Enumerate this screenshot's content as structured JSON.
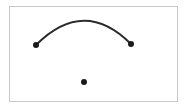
{
  "diagram": {
    "frame": {
      "x": 9.5,
      "y": 6.5,
      "width": 168,
      "height": 95,
      "stroke": "#c8c8c8"
    },
    "arc": {
      "start": {
        "x": 36,
        "y": 45
      },
      "control": {
        "x": 84,
        "y": -3
      },
      "end": {
        "x": 131,
        "y": 44
      },
      "stroke": "#2a2a2a",
      "width": 2
    },
    "points": [
      {
        "id": "left-endpoint",
        "x": 36,
        "y": 45,
        "r": 3
      },
      {
        "id": "right-endpoint",
        "x": 131,
        "y": 44,
        "r": 3
      },
      {
        "id": "center-point",
        "x": 84,
        "y": 82,
        "r": 3
      }
    ],
    "point_color": "#1a1a1a"
  }
}
